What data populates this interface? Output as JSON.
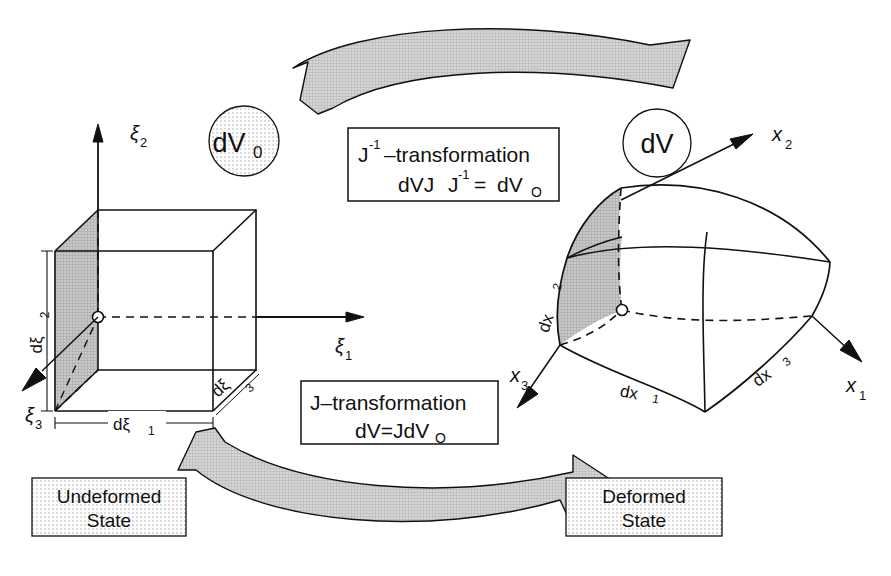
{
  "figure": {
    "colors": {
      "line": "#111111",
      "background": "#ffffff",
      "arrow_fill": "#cfcfcf",
      "shaded_face": "#c4c4c4",
      "stipple_fill": "#e9e9e9",
      "box_border": "#111111"
    }
  },
  "left_body": {
    "name": "undeformed-cube",
    "axes": [
      {
        "id": "xi2",
        "label": "ξ",
        "sub": "2"
      },
      {
        "id": "xi1",
        "label": "ξ",
        "sub": "1"
      },
      {
        "id": "xi3",
        "label": "ξ",
        "sub": "3"
      }
    ],
    "edge_labels": [
      {
        "id": "dxi2",
        "label": "dξ",
        "sub": "2"
      },
      {
        "id": "dxi1",
        "label": "dξ",
        "sub": "1"
      },
      {
        "id": "dxi3",
        "label": "dξ",
        "sub": "3"
      }
    ],
    "volume_badge": {
      "label": "dV",
      "sub": "0"
    },
    "state_caption": {
      "line1": "Undeformed",
      "line2": "State"
    }
  },
  "right_body": {
    "name": "deformed-body",
    "axes": [
      {
        "id": "x2",
        "label": "x",
        "sub": "2"
      },
      {
        "id": "x1",
        "label": "x",
        "sub": "1"
      },
      {
        "id": "x3",
        "label": "x",
        "sub": "3"
      }
    ],
    "edge_labels": [
      {
        "id": "dx2",
        "label": "dx",
        "sub": "2"
      },
      {
        "id": "dx1",
        "label": "dx",
        "sub": "1"
      },
      {
        "id": "dx3",
        "label": "dx",
        "sub": "3"
      }
    ],
    "volume_badge": {
      "label": "dV",
      "sub": ""
    },
    "state_caption": {
      "line1": "Deformed",
      "line2": "State"
    }
  },
  "transform_boxes": {
    "inverse": {
      "id": "j-inverse-transformation",
      "title_base": "J",
      "title_sup": "-1",
      "title_rest": "–transformation",
      "equation_a": "dVJ",
      "equation_sup": "-1",
      "equation_b": "=",
      "equation_c": "dV",
      "equation_sub": "O"
    },
    "forward": {
      "id": "j-transformation",
      "title": "J–transformation",
      "equation_a": "dV=JdV",
      "equation_sub": "O"
    }
  },
  "arrows": {
    "top": {
      "id": "inverse-transform-arrow",
      "direction": "right-to-left"
    },
    "bottom": {
      "id": "forward-transform-arrow",
      "direction": "left-to-right"
    }
  }
}
